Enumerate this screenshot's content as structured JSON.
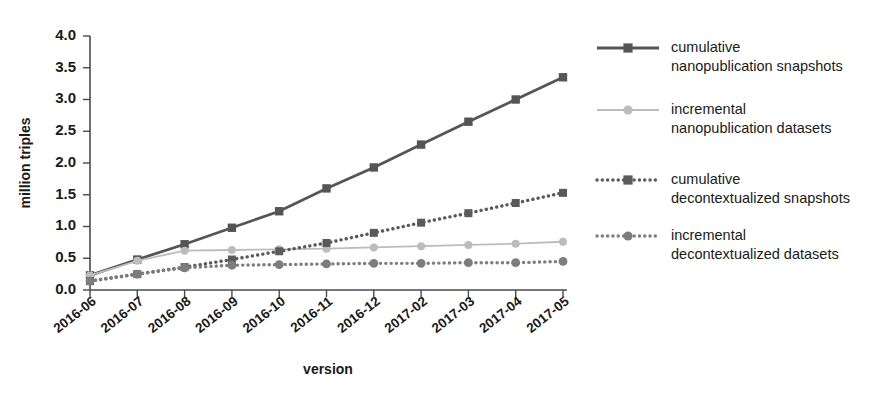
{
  "chart_data": {
    "type": "line",
    "title": "",
    "xlabel": "version",
    "ylabel": "million triples",
    "categories": [
      "2016-06",
      "2016-07",
      "2016-08",
      "2016-09",
      "2016-10",
      "2016-11",
      "2016-12",
      "2017-02",
      "2017-03",
      "2017-04",
      "2017-05"
    ],
    "ylim": [
      0.0,
      4.0
    ],
    "yticks": [
      "0.0",
      "0.5",
      "1.0",
      "1.5",
      "2.0",
      "2.5",
      "3.0",
      "3.5",
      "4.0"
    ],
    "ytick_values": [
      0.0,
      0.5,
      1.0,
      1.5,
      2.0,
      2.5,
      3.0,
      3.5,
      4.0
    ],
    "grid": false,
    "legend_position": "right",
    "series": [
      {
        "name": "cumulative nanopublication snapshots",
        "label_line1": "cumulative",
        "label_line2": "nanopublication snapshots",
        "color": "#555555",
        "style": "solid",
        "marker": "square",
        "values": [
          0.23,
          0.48,
          0.72,
          0.98,
          1.24,
          1.6,
          1.93,
          2.29,
          2.65,
          3.0,
          3.35
        ]
      },
      {
        "name": "incremental nanopublication datasets",
        "label_line1": "incremental",
        "label_line2": "nanopublication datasets",
        "color": "#bcbcbc",
        "style": "solid",
        "marker": "circle",
        "values": [
          0.23,
          0.46,
          0.62,
          0.63,
          0.64,
          0.65,
          0.67,
          0.69,
          0.71,
          0.73,
          0.76
        ]
      },
      {
        "name": "cumulative decontextualized snapshots",
        "label_line1": "cumulative",
        "label_line2": "decontextualized snapshots",
        "color": "#5a5a5a",
        "style": "dotted",
        "marker": "square",
        "values": [
          0.14,
          0.25,
          0.36,
          0.48,
          0.61,
          0.74,
          0.9,
          1.06,
          1.21,
          1.37,
          1.53
        ]
      },
      {
        "name": "incremental decontextualized datasets",
        "label_line1": "incremental",
        "label_line2": "decontextualized datasets",
        "color": "#7d7d7d",
        "style": "dotted",
        "marker": "circle",
        "values": [
          0.14,
          0.25,
          0.35,
          0.39,
          0.4,
          0.41,
          0.42,
          0.42,
          0.43,
          0.43,
          0.45
        ]
      }
    ]
  }
}
